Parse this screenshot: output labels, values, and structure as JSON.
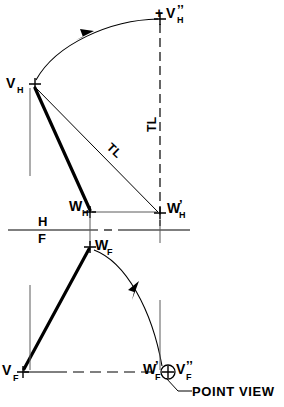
{
  "figure": {
    "type": "descriptive-geometry-construction",
    "title_text": "POINT VIEW",
    "background_color": "#ffffff",
    "ink_color": "#000000"
  },
  "labels": {
    "v_h": {
      "base": "V",
      "sub": "H",
      "prime": ""
    },
    "v_h_aux": {
      "base": "V",
      "sub": "H",
      "prime": "’’",
      "plusmark": "+"
    },
    "w_h": {
      "base": "W",
      "sub": "H",
      "prime": ""
    },
    "w_h_aux": {
      "base": "W",
      "sub": "H",
      "prime": "’"
    },
    "w_f": {
      "base": "W",
      "sub": "F",
      "prime": ""
    },
    "w_f_aux": {
      "base": "W",
      "sub": "F",
      "prime": "’"
    },
    "v_f": {
      "base": "V",
      "sub": "F",
      "prime": ""
    },
    "v_f_aux": {
      "base": "V",
      "sub": "F",
      "prime": "’’"
    },
    "fold_h": "H",
    "fold_f": "F",
    "true_length_diagonal": "TL",
    "true_length_vertical": "TL",
    "point_view": "POINT  VIEW"
  },
  "geometry": {
    "points": {
      "V_H": {
        "x": 33,
        "y": 84,
        "note": "horizontal-view vertex V"
      },
      "V_H_aux": {
        "x": 160,
        "y": 19,
        "note": "revolved V in auxiliary position"
      },
      "W_H": {
        "x": 90,
        "y": 212,
        "note": "horizontal-view point W"
      },
      "W_H_aux": {
        "x": 160,
        "y": 213,
        "note": "revolved W horizontal"
      },
      "W_F": {
        "x": 90,
        "y": 247,
        "note": "frontal-view point W"
      },
      "W_F_aux": {
        "x": 160,
        "y": 372,
        "note": "revolved W frontal / point view"
      },
      "V_F": {
        "x": 22,
        "y": 372,
        "note": "frontal-view vertex V"
      },
      "V_F_aux": {
        "x": 172,
        "y": 372,
        "note": "revolved V frontal coincident"
      }
    },
    "fold_line_y": 230,
    "vertical_dashed_x": 160,
    "point_view_circle": {
      "cx": 168,
      "cy": 372,
      "r": 7
    }
  },
  "annotations": {
    "arc_top_arrow_at": {
      "x": 86,
      "y": 35
    },
    "arc_bottom_arrow_at": {
      "x": 138,
      "y": 293
    },
    "leader_from": {
      "x": 170,
      "y": 380
    },
    "leader_to": {
      "x": 190,
      "y": 392
    }
  }
}
